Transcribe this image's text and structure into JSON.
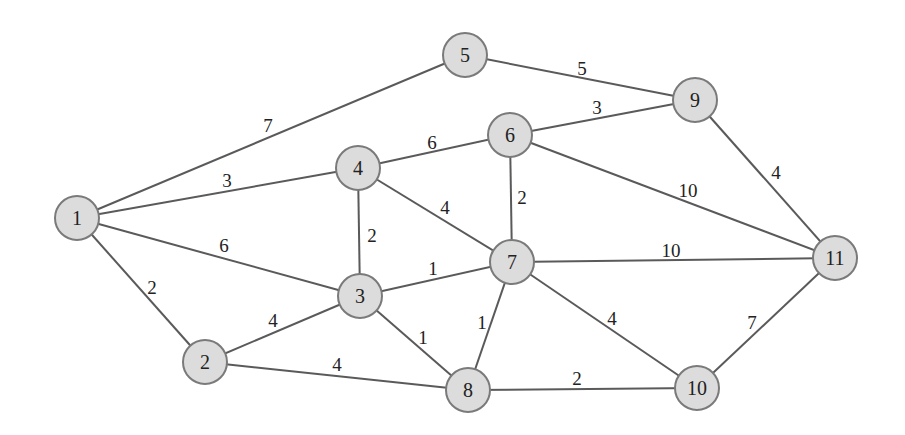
{
  "diagram": {
    "type": "weighted-undirected-graph",
    "nodes": [
      {
        "id": "1",
        "x": 77,
        "y": 218
      },
      {
        "id": "2",
        "x": 205,
        "y": 362
      },
      {
        "id": "3",
        "x": 360,
        "y": 296
      },
      {
        "id": "4",
        "x": 358,
        "y": 168
      },
      {
        "id": "5",
        "x": 465,
        "y": 55
      },
      {
        "id": "6",
        "x": 510,
        "y": 135
      },
      {
        "id": "7",
        "x": 512,
        "y": 262
      },
      {
        "id": "8",
        "x": 468,
        "y": 390
      },
      {
        "id": "9",
        "x": 695,
        "y": 100
      },
      {
        "id": "10",
        "x": 697,
        "y": 388
      },
      {
        "id": "11",
        "x": 835,
        "y": 258
      }
    ],
    "edges": [
      {
        "from": "1",
        "to": "5",
        "weight": "7",
        "lx": 268,
        "ly": 125
      },
      {
        "from": "1",
        "to": "4",
        "weight": "3",
        "lx": 227,
        "ly": 180
      },
      {
        "from": "1",
        "to": "3",
        "weight": "6",
        "lx": 224,
        "ly": 245
      },
      {
        "from": "1",
        "to": "2",
        "weight": "2",
        "lx": 152,
        "ly": 287
      },
      {
        "from": "2",
        "to": "3",
        "weight": "4",
        "lx": 273,
        "ly": 320
      },
      {
        "from": "2",
        "to": "8",
        "weight": "4",
        "lx": 337,
        "ly": 364
      },
      {
        "from": "3",
        "to": "4",
        "weight": "2",
        "lx": 372,
        "ly": 235
      },
      {
        "from": "3",
        "to": "7",
        "weight": "1",
        "lx": 433,
        "ly": 268
      },
      {
        "from": "3",
        "to": "8",
        "weight": "1",
        "lx": 423,
        "ly": 337
      },
      {
        "from": "4",
        "to": "6",
        "weight": "6",
        "lx": 432,
        "ly": 142
      },
      {
        "from": "4",
        "to": "7",
        "weight": "4",
        "lx": 445,
        "ly": 207
      },
      {
        "from": "5",
        "to": "9",
        "weight": "5",
        "lx": 582,
        "ly": 68
      },
      {
        "from": "6",
        "to": "9",
        "weight": "3",
        "lx": 597,
        "ly": 107
      },
      {
        "from": "6",
        "to": "7",
        "weight": "2",
        "lx": 522,
        "ly": 197
      },
      {
        "from": "6",
        "to": "11",
        "weight": "10",
        "lx": 688,
        "ly": 190
      },
      {
        "from": "7",
        "to": "11",
        "weight": "10",
        "lx": 671,
        "ly": 250
      },
      {
        "from": "7",
        "to": "8",
        "weight": "1",
        "lx": 482,
        "ly": 322
      },
      {
        "from": "7",
        "to": "10",
        "weight": "4",
        "lx": 612,
        "ly": 318
      },
      {
        "from": "8",
        "to": "10",
        "weight": "2",
        "lx": 577,
        "ly": 378
      },
      {
        "from": "9",
        "to": "11",
        "weight": "4",
        "lx": 776,
        "ly": 172
      },
      {
        "from": "10",
        "to": "11",
        "weight": "7",
        "lx": 752,
        "ly": 322
      }
    ],
    "node_radius": 22,
    "colors": {
      "node_fill": "#dcdcdc",
      "node_stroke": "#7a7a7a",
      "edge": "#5a5a5a",
      "text": "#222222"
    }
  }
}
